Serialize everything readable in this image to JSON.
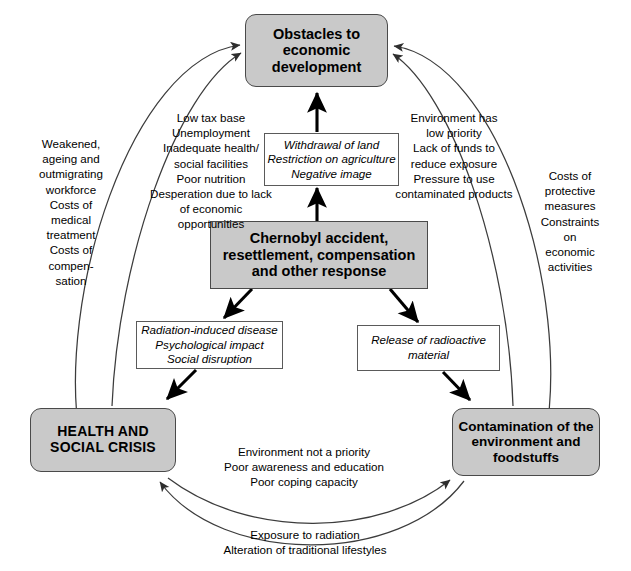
{
  "diagram": {
    "colors": {
      "node_fill": "#c9c9c9",
      "node_border": "#4a4a4a",
      "label_border": "#5a5a5a",
      "arrow": "#000000",
      "arc": "#3c3c3c",
      "background": "#ffffff"
    }
  },
  "nodes": {
    "obstacles": {
      "name": "obstacles-to-economic-development",
      "lines": [
        "Obstacles to",
        "economic",
        "development"
      ],
      "text": "Obstacles to\neconomic\ndevelopment"
    },
    "center": {
      "name": "chernobyl-accident",
      "lines": [
        "Chernobyl accident,",
        "resettlement, compensation",
        "and other response"
      ],
      "text": "Chernobyl accident,\nresettlement, compensation\nand other response"
    },
    "health": {
      "name": "health-and-social-crisis",
      "lines": [
        "HEALTH AND",
        "SOCIAL CRISIS"
      ],
      "text": "HEALTH AND\nSOCIAL CRISIS"
    },
    "contamination": {
      "name": "contamination-of-environment",
      "lines": [
        "Contamination of the",
        "environment and",
        "foodstuffs"
      ],
      "text": "Contamination of the\nenvironment and\nfoodstuffs"
    }
  },
  "label_boxes": {
    "withdrawal": {
      "lines": [
        "Withdrawal of land",
        "Restriction on agriculture",
        "Negative image"
      ],
      "text": "Withdrawal of land\nRestriction on agriculture\nNegative image"
    },
    "radiation": {
      "lines": [
        "Radiation-induced disease",
        "Psychological impact",
        "Social disruption"
      ],
      "text": "Radiation-induced disease\nPsychological impact\nSocial disruption"
    },
    "release": {
      "lines": [
        "Release of radioactive",
        "material"
      ],
      "text": "Release of radioactive\nmaterial"
    }
  },
  "annotations": {
    "low_tax_base": {
      "lines": [
        "Low tax base",
        "Unemployment",
        "Inadequate health/",
        "social facilities",
        "Poor nutrition",
        "Desperation due to lack",
        "of economic opportunities"
      ],
      "text": "Low tax base\nUnemployment\nInadequate health/\nsocial facilities\nPoor nutrition\nDesperation due to lack\nof economic opportunities"
    },
    "environment_low_priority": {
      "lines": [
        "Environment has",
        "low priority",
        "Lack of funds to",
        "reduce exposure",
        "Pressure to use",
        "contaminated products"
      ],
      "text": "Environment has\nlow priority\nLack of funds to\nreduce exposure\nPressure to use\ncontaminated products"
    },
    "weakened_workforce": {
      "lines": [
        "Weakened,",
        "ageing and",
        "outmigrating",
        "workforce",
        "Costs of",
        "medical",
        "treatment",
        "Costs of",
        "compen-",
        "sation"
      ],
      "text": "Weakened,\nageing and\noutmigrating\nworkforce\nCosts of\nmedical\ntreatment\nCosts of\ncompen-\nsation"
    },
    "costs_protective": {
      "lines": [
        "Costs of",
        "protective",
        "measures",
        "Constraints",
        "on",
        "economic",
        "activities"
      ],
      "text": "Costs of\nprotective\nmeasures\nConstraints\non\neconomic\nactivities"
    },
    "environment_not_priority": {
      "lines": [
        "Environment not a priority",
        "Poor awareness and education",
        "Poor coping capacity"
      ],
      "text": "Environment not a priority\nPoor awareness and education\nPoor coping capacity"
    },
    "exposure_radiation": {
      "lines": [
        "Exposure to radiation",
        "Alteration of traditional lifestyles"
      ],
      "text": "Exposure to radiation\nAlteration of traditional lifestyles"
    }
  },
  "connectors": [
    {
      "name": "center-to-obstacles",
      "from": "center",
      "to": "obstacles",
      "style": "thick-straight",
      "via": "withdrawal"
    },
    {
      "name": "center-to-health",
      "from": "center",
      "to": "health",
      "style": "thick-straight",
      "via": "radiation"
    },
    {
      "name": "center-to-contamination",
      "from": "center",
      "to": "contamination",
      "style": "thick-straight",
      "via": "release"
    },
    {
      "name": "health-to-obstacles-inner",
      "from": "health",
      "to": "obstacles",
      "style": "thin-arc",
      "label": "low_tax_base"
    },
    {
      "name": "health-to-obstacles-outer",
      "from": "health",
      "to": "obstacles",
      "style": "thin-arc",
      "label": "weakened_workforce"
    },
    {
      "name": "contamination-to-obstacles-inner",
      "from": "contamination",
      "to": "obstacles",
      "style": "thin-arc",
      "label": "environment_low_priority"
    },
    {
      "name": "contamination-to-obstacles-outer",
      "from": "contamination",
      "to": "obstacles",
      "style": "thin-arc",
      "label": "costs_protective"
    },
    {
      "name": "health-to-contamination",
      "from": "health",
      "to": "contamination",
      "style": "thin-arc",
      "label": "environment_not_priority"
    },
    {
      "name": "contamination-to-health",
      "from": "contamination",
      "to": "health",
      "style": "thin-arc",
      "label": "exposure_radiation"
    }
  ]
}
